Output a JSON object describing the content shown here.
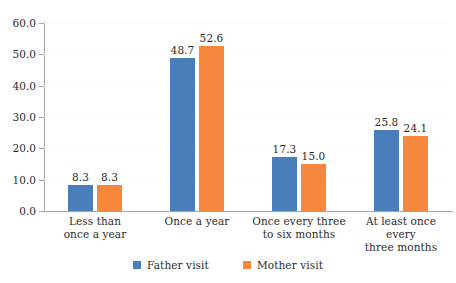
{
  "chart_data": {
    "type": "bar",
    "title": "",
    "subtitle": "",
    "xlabel": "",
    "ylabel": "",
    "ylim": [
      0,
      60
    ],
    "ytick_step": 10,
    "grid": true,
    "legend_position": "bottom",
    "categories": [
      "Less than once a year",
      "Once a year",
      "Once every three to six months",
      "At least once every three months"
    ],
    "category_label_lines": [
      [
        "Less than",
        "once a year"
      ],
      [
        "Once a year"
      ],
      [
        "Once every three",
        "to six months"
      ],
      [
        "At least once every",
        "three months"
      ]
    ],
    "ytick_labels": [
      "0.0",
      "10.0",
      "20.0",
      "30.0",
      "40.0",
      "50.0",
      "60.0"
    ],
    "ytick_values": [
      0,
      10,
      20,
      30,
      40,
      50,
      60
    ],
    "series": [
      {
        "name": "Father visit",
        "color": "#4a7ebb",
        "values": [
          8.3,
          48.7,
          17.3,
          25.8
        ],
        "value_labels": [
          "8.3",
          "48.7",
          "17.3",
          "25.8"
        ]
      },
      {
        "name": "Mother visit",
        "color": "#f5883c",
        "values": [
          8.3,
          52.6,
          15.0,
          24.1
        ],
        "value_labels": [
          "8.3",
          "52.6",
          "15.0",
          "24.1"
        ]
      }
    ]
  },
  "legend": {
    "items": [
      {
        "label": "Father visit",
        "color": "#4a7ebb"
      },
      {
        "label": "Mother visit",
        "color": "#f5883c"
      }
    ]
  },
  "colors": {
    "series_0": "#4a7ebb",
    "series_1": "#f5883c",
    "axis": "#a6a6a6",
    "gridline": "#fbfbfa",
    "text": "#2b2b2b",
    "background": "#ffffff"
  }
}
